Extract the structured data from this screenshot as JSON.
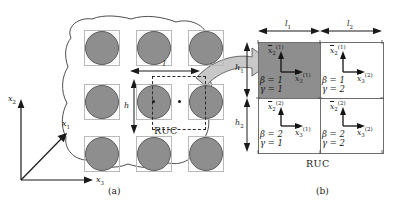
{
  "figure": {
    "captions": {
      "a": "(a)",
      "b": "(b)"
    },
    "colors": {
      "fiber_fill": "#8e8e8e",
      "fiber_stroke": "#5d5d5d",
      "shaded_subcell": "#8e8e8e",
      "matrix_fill": "#ffffff",
      "cell_stroke": "#6f6f6f",
      "dashed_stroke": "#2b2b2b",
      "arrow_fill": "#c8c8c8",
      "ink": "#1a1a1a"
    }
  },
  "panel_a": {
    "name": "composite-microstructure",
    "ruc_label": "RUC",
    "dimensions": {
      "width_label": "l",
      "height_label": "h"
    },
    "global_axes": [
      {
        "name": "x2",
        "base": "x",
        "sub": "2",
        "direction": "up"
      },
      {
        "name": "x1",
        "base": "x",
        "sub": "1",
        "direction": "diagonal"
      },
      {
        "name": "x3",
        "base": "x",
        "sub": "3",
        "direction": "right"
      }
    ],
    "fiber_grid": {
      "rows": 3,
      "cols": 3,
      "shape": "circle"
    },
    "center_dots": 2
  },
  "panel_b": {
    "name": "repeating-unit-cell",
    "ruc_label": "RUC",
    "dimensions": [
      {
        "name": "l1",
        "base": "l",
        "sub": "1",
        "orientation": "horizontal"
      },
      {
        "name": "l2",
        "base": "l",
        "sub": "2",
        "orientation": "horizontal"
      },
      {
        "name": "h1",
        "base": "h",
        "sub": "1",
        "orientation": "vertical"
      },
      {
        "name": "h2",
        "base": "h",
        "sub": "2",
        "orientation": "vertical"
      }
    ],
    "subcells": [
      {
        "name": "subcell-b1-g1",
        "beta": "β = 1",
        "gamma": "γ = 1",
        "shaded": true,
        "axis_vertical": {
          "base": "x",
          "sub": "2",
          "sup": "(1)"
        },
        "axis_horizontal": {
          "base": "x",
          "sub": "3",
          "sup": "(1)"
        }
      },
      {
        "name": "subcell-b1-g2",
        "beta": "β = 1",
        "gamma": "γ = 2",
        "shaded": false,
        "axis_vertical": {
          "base": "x",
          "sub": "2",
          "sup": "(1)"
        },
        "axis_horizontal": {
          "base": "x",
          "sub": "3",
          "sup": "(2)"
        }
      },
      {
        "name": "subcell-b2-g1",
        "beta": "β = 2",
        "gamma": "γ = 1",
        "shaded": false,
        "axis_vertical": {
          "base": "x",
          "sub": "2",
          "sup": "(2)"
        },
        "axis_horizontal": {
          "base": "x",
          "sub": "3",
          "sup": "(1)"
        }
      },
      {
        "name": "subcell-b2-g2",
        "beta": "β = 2",
        "gamma": "γ = 2",
        "shaded": false,
        "axis_vertical": {
          "base": "x",
          "sub": "2",
          "sup": "(2)"
        },
        "axis_horizontal": {
          "base": "x",
          "sub": "3",
          "sup": "(2)"
        }
      }
    ]
  }
}
